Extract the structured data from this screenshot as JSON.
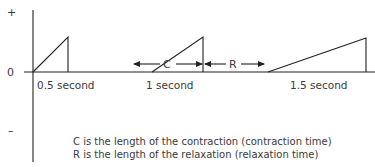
{
  "diagram": {
    "axis_labels": {
      "plus": "+",
      "zero": "0",
      "minus": "–"
    },
    "waves": [
      {
        "label": "0.5 second"
      },
      {
        "label": "1 second"
      },
      {
        "label": "1.5 second"
      }
    ],
    "segment_labels": {
      "contraction": "C",
      "relaxation": "R"
    },
    "captions": [
      "C is the length of the contraction (contraction time)",
      "R is the length of the relaxation (relaxation time)"
    ]
  }
}
